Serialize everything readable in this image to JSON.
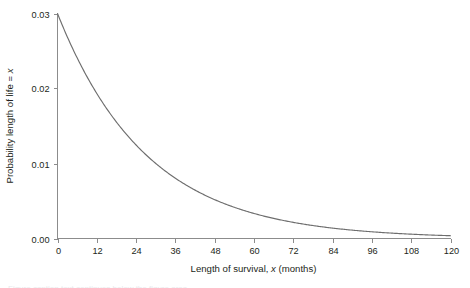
{
  "chart_data": {
    "type": "line",
    "title": "",
    "subtitle": "",
    "xlabel_parts": {
      "pre": "Length of survival, ",
      "italic": "x",
      "post": " (months)"
    },
    "xlabel": "Length of survival, x (months)",
    "ylabel_parts": {
      "pre": "Probability length of life = ",
      "italic": "x",
      "post": ""
    },
    "ylabel": "Probability length of life = x",
    "xlim": [
      0,
      120
    ],
    "ylim": [
      0,
      0.03
    ],
    "xticks": [
      0,
      12,
      24,
      36,
      48,
      60,
      72,
      84,
      96,
      108,
      120
    ],
    "xticklabels": [
      "0",
      "12",
      "24",
      "36",
      "48",
      "60",
      "72",
      "84",
      "96",
      "108",
      "120"
    ],
    "yticks": [
      0.0,
      0.01,
      0.02,
      0.03
    ],
    "yticklabels": [
      "0.00",
      "0.01",
      "0.02",
      "0.03"
    ],
    "grid": false,
    "legend": "none",
    "series": [
      {
        "name": "exponential survival density",
        "model": "p(x) = 0.03 * exp(-0.0366 * x)",
        "decay_rate_per_month": 0.0366,
        "x": [
          0,
          6,
          12,
          18,
          24,
          30,
          36,
          42,
          48,
          54,
          60,
          66,
          72,
          78,
          84,
          90,
          96,
          102,
          108,
          114,
          120
        ],
        "y": [
          0.03,
          0.0241,
          0.0193,
          0.0155,
          0.0125,
          0.01,
          0.008,
          0.0064,
          0.0052,
          0.0042,
          0.0033,
          0.0027,
          0.0021,
          0.0017,
          0.0014,
          0.0011,
          0.0009,
          0.0007,
          0.0006,
          0.0005,
          0.0004
        ],
        "color": "#6e6e6e"
      }
    ],
    "annotations": []
  },
  "style": {
    "axis_color": "#8c8c8c",
    "text_color": "#231f20",
    "curve_color": "#6e6e6e",
    "background": "#ffffff"
  },
  "caption": {
    "cut_off_line": "Figure caption text continues below the figure area"
  }
}
